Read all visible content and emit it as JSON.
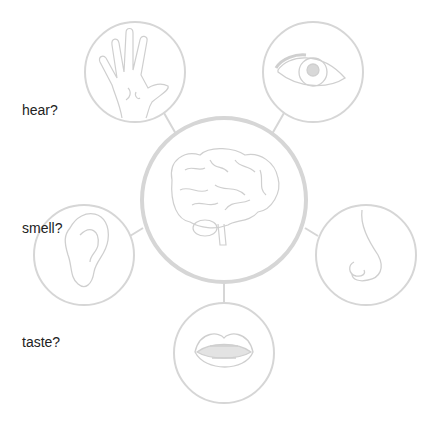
{
  "labels": {
    "hear": "hear?",
    "smell": "smell?",
    "taste": "taste?"
  },
  "nodes": {
    "center": {
      "name": "brain"
    },
    "top_left": {
      "name": "hand"
    },
    "top_right": {
      "name": "eye"
    },
    "mid_left": {
      "name": "ear"
    },
    "mid_right": {
      "name": "nose"
    },
    "bottom": {
      "name": "mouth"
    }
  },
  "colors": {
    "stroke": "#d6d6d6",
    "text": "#222222"
  }
}
